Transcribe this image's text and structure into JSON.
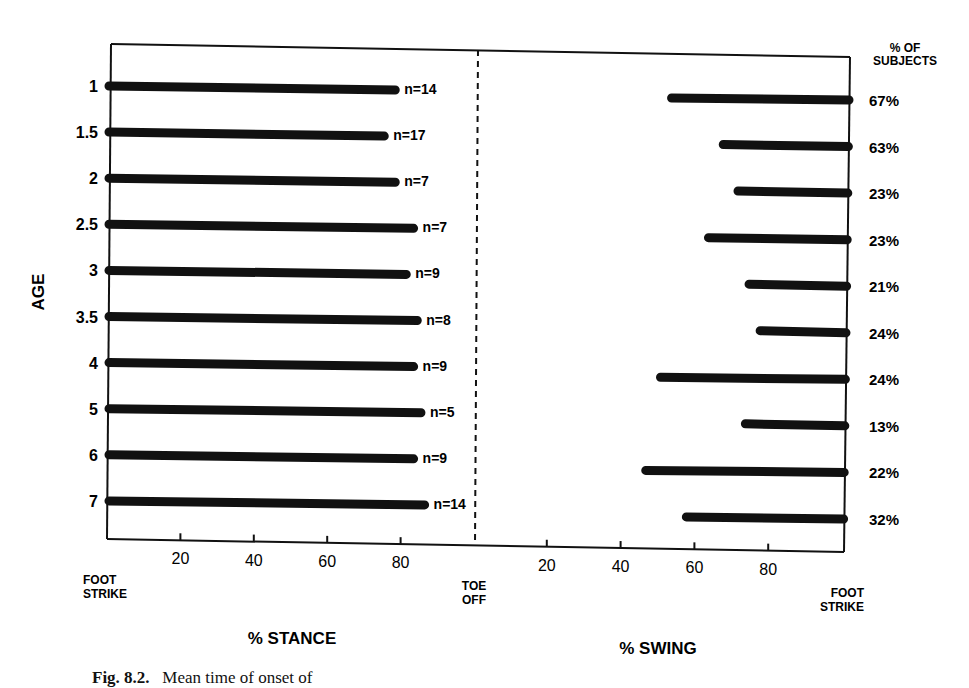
{
  "chart_data": {
    "type": "bar",
    "orientation": "horizontal",
    "title": "",
    "ylabel": "AGE",
    "categories": [
      "1",
      "1.5",
      "2",
      "2.5",
      "3",
      "3.5",
      "4",
      "5",
      "6",
      "7"
    ],
    "series": [
      {
        "name": "% Stance (foot strike to end of bar)",
        "values": [
          78,
          75,
          78,
          83,
          81,
          84,
          83,
          85,
          83,
          86
        ],
        "annotations": [
          "n=14",
          "n=17",
          "n=7",
          "n=7",
          "n=9",
          "n=8",
          "n=9",
          "n=5",
          "n=9",
          "n=14"
        ]
      },
      {
        "name": "% Swing (onset to foot strike)",
        "start_values": [
          53,
          67,
          71,
          63,
          74,
          77,
          50,
          73,
          46,
          57
        ],
        "end_value": 100,
        "annotations": [
          "67%",
          "63%",
          "23%",
          "23%",
          "21%",
          "24%",
          "24%",
          "13%",
          "22%",
          "32%"
        ]
      }
    ],
    "left_axis": {
      "xlabel": "% STANCE",
      "ticks": [
        20,
        40,
        60,
        80
      ],
      "xlim": [
        0,
        100
      ],
      "start_label": "FOOT\nSTRIKE",
      "end_label": "TOE\nOFF"
    },
    "right_axis": {
      "xlabel": "% SWING",
      "ticks": [
        20,
        40,
        60,
        80
      ],
      "xlim": [
        0,
        100
      ],
      "start_label": "TOE\nOFF",
      "end_label": "FOOT\nSTRIKE"
    },
    "right_header": "% OF\nSUBJECTS",
    "grid": false,
    "divider": "dashed line at toe off"
  },
  "labels": {
    "age": "AGE",
    "stance": "% STANCE",
    "swing": "% SWING",
    "foot_strike_1": "FOOT",
    "foot_strike_2": "STRIKE",
    "toe_off_1": "TOE",
    "toe_off_2": "OFF",
    "pct_subjects_1": "% OF",
    "pct_subjects_2": "SUBJECTS"
  },
  "caption": {
    "label": "Fig. 8.2.",
    "text": "Mean time of onset of"
  }
}
